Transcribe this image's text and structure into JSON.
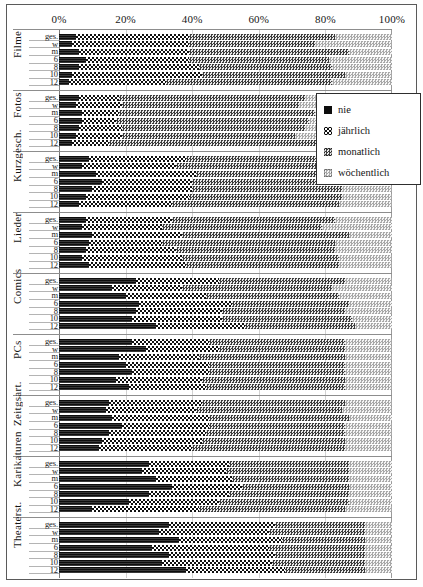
{
  "legend": {
    "position": "inside-top-right",
    "items": [
      {
        "label": "nie",
        "key": "nie",
        "color": "#0d0d0d",
        "pattern": "solid-black"
      },
      {
        "label": "jährlich",
        "key": "jaehrlich",
        "color": "#101010",
        "pattern": "coarse-checker"
      },
      {
        "label": "monatlich",
        "key": "monatlich",
        "color": "#3c3c3c",
        "pattern": "medium-halftone"
      },
      {
        "label": "wöchentlich",
        "key": "woechentlich",
        "color": "#a8a8a8",
        "pattern": "light-halftone"
      }
    ]
  },
  "chart_data": {
    "type": "bar",
    "title": "",
    "subtitle": "",
    "xlabel": "",
    "ylabel": "",
    "orientation": "horizontal",
    "stacked": true,
    "normalized_percent": true,
    "grid": true,
    "xlim": [
      0,
      100
    ],
    "tick_labels": [
      "0%",
      "20%",
      "40%",
      "60%",
      "80%",
      "100%"
    ],
    "tick_values": [
      0,
      20,
      40,
      60,
      80,
      100
    ],
    "series_names": [
      "nie",
      "jährlich",
      "monatlich",
      "wöchentlich"
    ],
    "subgroups": [
      "ges.",
      "w",
      "m",
      "6",
      "8",
      "10",
      "12"
    ],
    "categories": [
      "Filme",
      "Fotos",
      "Kurzgesch.",
      "Lieder",
      "Comics",
      "PCs",
      "Zeitgsart.",
      "Karikaturen",
      "Theaterst."
    ],
    "groups": [
      {
        "category": "Filme",
        "rows": [
          {
            "subgroup": "ges.",
            "values": [
              5,
              34,
              44,
              17
            ]
          },
          {
            "subgroup": "w",
            "values": [
              4,
              35,
              38,
              23
            ]
          },
          {
            "subgroup": "m",
            "values": [
              6,
              33,
              48,
              13
            ]
          },
          {
            "subgroup": "6",
            "values": [
              8,
              31,
              42,
              19
            ]
          },
          {
            "subgroup": "8",
            "values": [
              6,
              36,
              40,
              18
            ]
          },
          {
            "subgroup": "10",
            "values": [
              4,
              39,
              43,
              14
            ]
          },
          {
            "subgroup": "12",
            "values": [
              3,
              29,
              50,
              18
            ]
          }
        ]
      },
      {
        "category": "Fotos",
        "rows": [
          {
            "subgroup": "ges.",
            "values": [
              6,
              12,
              56,
              26
            ]
          },
          {
            "subgroup": "w",
            "values": [
              5,
              14,
              53,
              28
            ]
          },
          {
            "subgroup": "m",
            "values": [
              7,
              11,
              59,
              23
            ]
          },
          {
            "subgroup": "6",
            "values": [
              7,
              10,
              58,
              25
            ]
          },
          {
            "subgroup": "8",
            "values": [
              6,
              13,
              55,
              26
            ]
          },
          {
            "subgroup": "10",
            "values": [
              5,
              14,
              52,
              29
            ]
          },
          {
            "subgroup": "12",
            "values": [
              4,
              11,
              63,
              22
            ]
          }
        ]
      },
      {
        "category": "Kurzgesch.",
        "rows": [
          {
            "subgroup": "ges.",
            "values": [
              9,
              29,
              46,
              16
            ]
          },
          {
            "subgroup": "w",
            "values": [
              7,
              28,
              47,
              18
            ]
          },
          {
            "subgroup": "m",
            "values": [
              11,
              30,
              45,
              14
            ]
          },
          {
            "subgroup": "6",
            "values": [
              13,
              27,
              44,
              16
            ]
          },
          {
            "subgroup": "8",
            "values": [
              10,
              30,
              45,
              15
            ]
          },
          {
            "subgroup": "10",
            "values": [
              8,
              31,
              46,
              15
            ]
          },
          {
            "subgroup": "12",
            "values": [
              6,
              28,
              50,
              16
            ]
          }
        ]
      },
      {
        "category": "Lieder",
        "rows": [
          {
            "subgroup": "ges.",
            "values": [
              8,
              26,
              49,
              17
            ]
          },
          {
            "subgroup": "w",
            "values": [
              7,
              24,
              48,
              21
            ]
          },
          {
            "subgroup": "m",
            "values": [
              10,
              27,
              50,
              13
            ]
          },
          {
            "subgroup": "6",
            "values": [
              9,
              22,
              52,
              17
            ]
          },
          {
            "subgroup": "8",
            "values": [
              8,
              27,
              48,
              17
            ]
          },
          {
            "subgroup": "10",
            "values": [
              7,
              30,
              47,
              16
            ]
          },
          {
            "subgroup": "12",
            "values": [
              9,
              29,
              46,
              16
            ]
          }
        ]
      },
      {
        "category": "Comics",
        "rows": [
          {
            "subgroup": "ges.",
            "values": [
              23,
              25,
              38,
              14
            ]
          },
          {
            "subgroup": "w",
            "values": [
              16,
              21,
              45,
              18
            ]
          },
          {
            "subgroup": "m",
            "values": [
              20,
              24,
              40,
              16
            ]
          },
          {
            "subgroup": "6",
            "values": [
              24,
              28,
              35,
              13
            ]
          },
          {
            "subgroup": "8",
            "values": [
              23,
              26,
              37,
              14
            ]
          },
          {
            "subgroup": "10",
            "values": [
              22,
              27,
              39,
              12
            ]
          },
          {
            "subgroup": "12",
            "values": [
              29,
              27,
              33,
              11
            ]
          }
        ]
      },
      {
        "category": "PCs",
        "rows": [
          {
            "subgroup": "ges.",
            "values": [
              22,
              23,
              41,
              14
            ]
          },
          {
            "subgroup": "w",
            "values": [
              26,
              22,
              38,
              14
            ]
          },
          {
            "subgroup": "m",
            "values": [
              18,
              24,
              44,
              14
            ]
          },
          {
            "subgroup": "6",
            "values": [
              20,
              25,
              41,
              14
            ]
          },
          {
            "subgroup": "8",
            "values": [
              22,
              23,
              41,
              14
            ]
          },
          {
            "subgroup": "10",
            "values": [
              17,
              26,
              43,
              14
            ]
          },
          {
            "subgroup": "12",
            "values": [
              21,
              23,
              42,
              14
            ]
          }
        ]
      },
      {
        "category": "Zeitgsart.",
        "rows": [
          {
            "subgroup": "ges.",
            "values": [
              15,
              28,
              43,
              14
            ]
          },
          {
            "subgroup": "w",
            "values": [
              14,
              27,
              44,
              15
            ]
          },
          {
            "subgroup": "m",
            "values": [
              16,
              29,
              42,
              13
            ]
          },
          {
            "subgroup": "6",
            "values": [
              19,
              26,
              41,
              14
            ]
          },
          {
            "subgroup": "8",
            "values": [
              15,
              29,
              42,
              14
            ]
          },
          {
            "subgroup": "10",
            "values": [
              13,
              30,
              43,
              14
            ]
          },
          {
            "subgroup": "12",
            "values": [
              12,
              28,
              46,
              14
            ]
          }
        ]
      },
      {
        "category": "Karikaturen",
        "rows": [
          {
            "subgroup": "ges.",
            "values": [
              27,
              24,
              36,
              13
            ]
          },
          {
            "subgroup": "w",
            "values": [
              25,
              25,
              37,
              13
            ]
          },
          {
            "subgroup": "m",
            "values": [
              29,
              23,
              35,
              13
            ]
          },
          {
            "subgroup": "6",
            "values": [
              34,
              21,
              32,
              13
            ]
          },
          {
            "subgroup": "8",
            "values": [
              27,
              24,
              36,
              13
            ]
          },
          {
            "subgroup": "10",
            "values": [
              21,
              27,
              39,
              13
            ]
          },
          {
            "subgroup": "12",
            "values": [
              10,
              32,
              44,
              14
            ]
          }
        ]
      },
      {
        "category": "Theaterst.",
        "rows": [
          {
            "subgroup": "ges.",
            "values": [
              33,
              32,
              27,
              8
            ]
          },
          {
            "subgroup": "w",
            "values": [
              30,
              33,
              29,
              8
            ]
          },
          {
            "subgroup": "m",
            "values": [
              36,
              31,
              25,
              8
            ]
          },
          {
            "subgroup": "6",
            "values": [
              28,
              35,
              29,
              8
            ]
          },
          {
            "subgroup": "8",
            "values": [
              33,
              32,
              27,
              8
            ]
          },
          {
            "subgroup": "10",
            "values": [
              31,
              33,
              28,
              8
            ]
          },
          {
            "subgroup": "12",
            "values": [
              38,
              30,
              24,
              8
            ]
          }
        ]
      }
    ]
  }
}
